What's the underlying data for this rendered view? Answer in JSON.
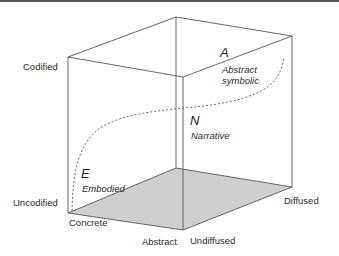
{
  "diagram": {
    "type": "3d-cube",
    "colors": {
      "edge": "#555555",
      "floor_fill": "#cfcfcf",
      "curve": "#555555",
      "text": "#2a2a2a"
    },
    "vertical_axis": {
      "top_label": "Codified",
      "bottom_label": "Uncodified"
    },
    "left_floor_axis": {
      "near_label": "Concrete",
      "far_label": "Abstract"
    },
    "right_floor_axis": {
      "near_label": "Undiffused",
      "far_label": "Diffused"
    },
    "points": [
      {
        "letter": "A",
        "label": "Abstract symbolic",
        "label_line1": "Abstract",
        "label_line2": "symbolic"
      },
      {
        "letter": "N",
        "label": "Narrative"
      },
      {
        "letter": "E",
        "label": "Embodied"
      }
    ]
  }
}
